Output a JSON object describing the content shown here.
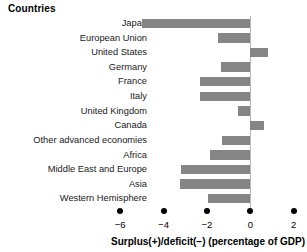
{
  "header": {
    "title": "Countries"
  },
  "axis": {
    "x_title": "Surplus(+)/deficit(−) (percentage of GDP)",
    "ticks": [
      "−6",
      "−4",
      "−2",
      "0",
      "2"
    ]
  },
  "chart_data": {
    "type": "bar",
    "orientation": "horizontal",
    "title": "Countries",
    "xlabel": "Surplus(+)/deficit(−) (percentage of GDP)",
    "ylabel": "",
    "xlim": [
      -6.8,
      2.6
    ],
    "xticks": [
      -6,
      -4,
      -2,
      0,
      2
    ],
    "xticklabels": [
      "−6",
      "−4",
      "−2",
      "0",
      "2"
    ],
    "grid": false,
    "legend": false,
    "bar_color": "#858585",
    "categories": [
      "Japan",
      "European Union",
      "United States",
      "Germany",
      "France",
      "Italy",
      "United Kingdom",
      "Canada",
      "Other advanced economies",
      "Africa",
      "Middle East and Europe",
      "Asia",
      "Western Hemisphere"
    ],
    "values": [
      -5.0,
      -1.5,
      0.8,
      -1.35,
      -2.3,
      -2.3,
      -0.55,
      0.65,
      -1.3,
      -1.85,
      -3.2,
      -3.25,
      -1.95
    ]
  }
}
